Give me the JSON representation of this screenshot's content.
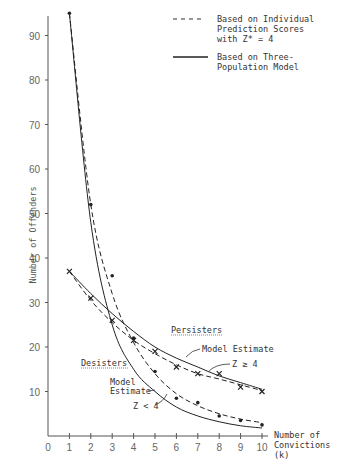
{
  "chart_data": {
    "type": "line",
    "title": "",
    "xlabel": "Number of Convictions (k)",
    "xlabel_lines": [
      "Number of",
      "Convictions",
      "(k)"
    ],
    "ylabel": "Number of Offenders",
    "xlim": [
      0,
      10
    ],
    "ylim": [
      0,
      95
    ],
    "x_ticks": [
      0,
      1,
      2,
      3,
      4,
      5,
      6,
      7,
      8,
      9,
      10
    ],
    "y_ticks": [
      10,
      20,
      30,
      40,
      50,
      60,
      70,
      80,
      90
    ],
    "grid": false,
    "legend_position": "top-right",
    "legend": [
      {
        "style": "dashed",
        "lines": [
          "Based on Individual",
          "Prediction Scores",
          "with Z* = 4"
        ]
      },
      {
        "style": "solid",
        "lines": [
          "Based on Three-",
          "Population Model"
        ]
      }
    ],
    "x": [
      1,
      2,
      3,
      4,
      5,
      6,
      7,
      8,
      9,
      10
    ],
    "series": [
      {
        "name": "Persisters Z ≥ 4 (observed)",
        "marker": "x",
        "values": [
          37,
          31,
          26,
          21.5,
          19,
          15.5,
          14,
          14,
          11,
          10
        ]
      },
      {
        "name": "Desisters Z < 4 (observed)",
        "marker": "dot",
        "values": [
          95,
          52,
          36,
          22,
          14.5,
          8.5,
          7.5,
          4.5,
          3.5,
          2.5
        ]
      },
      {
        "name": "Persisters Model Estimate",
        "style": "solid",
        "values": [
          37,
          32,
          27.5,
          23.5,
          20,
          17.5,
          15.5,
          13.5,
          12,
          10.5
        ]
      },
      {
        "name": "Desisters Model Estimate",
        "style": "solid",
        "values": [
          95,
          48,
          25,
          15,
          10,
          6.5,
          4.5,
          3.2,
          2.3,
          1.8
        ]
      },
      {
        "name": "Persisters fit (Z ≥ 4)",
        "style": "dashed",
        "values": [
          37,
          30.5,
          25.5,
          21.5,
          18.5,
          16,
          14,
          12.8,
          11.5,
          10.2
        ]
      },
      {
        "name": "Desisters fit (Z < 4)",
        "style": "dashed",
        "values": [
          95,
          52,
          32,
          21,
          14,
          9.5,
          6.8,
          5,
          3.8,
          3
        ]
      }
    ],
    "annotations": [
      {
        "text": "Persisters",
        "underline": true
      },
      {
        "text": "Model Estimate",
        "group": "persisters"
      },
      {
        "text": "Z ≥ 4"
      },
      {
        "text": "Desisters",
        "underline": true
      },
      {
        "text": "Model",
        "group": "desisters"
      },
      {
        "text": "Estimate",
        "group": "desisters"
      },
      {
        "text": "Z < 4"
      }
    ]
  }
}
